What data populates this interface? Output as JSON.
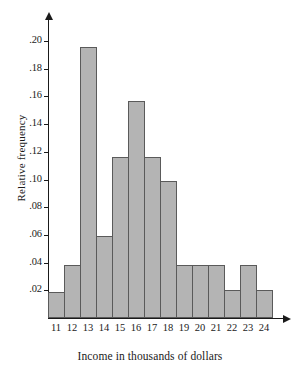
{
  "chart_data": {
    "type": "bar",
    "title": "",
    "subtitle": "",
    "xlabel": "Income in thousands of dollars",
    "ylabel": "Relative frequency",
    "categories": [
      "11",
      "12",
      "13",
      "14",
      "15",
      "16",
      "17",
      "18",
      "19",
      "20",
      "21",
      "22",
      "23",
      "24"
    ],
    "values": [
      0.019,
      0.038,
      0.196,
      0.059,
      0.116,
      0.157,
      0.116,
      0.099,
      0.038,
      0.038,
      0.038,
      0.02,
      0.038,
      0.02
    ],
    "xlim": [
      10.5,
      24.5
    ],
    "ylim": [
      0,
      0.205
    ],
    "ytick_labels": [
      ".20",
      ".18",
      ".16",
      ".14",
      ".12",
      ".10",
      ".08",
      ".06",
      ".04",
      ".02"
    ],
    "ytick_values": [
      0.2,
      0.18,
      0.16,
      0.14,
      0.12,
      0.1,
      0.08,
      0.06,
      0.04,
      0.02
    ],
    "xtick_labels": [
      "11",
      "12",
      "13",
      "14",
      "15",
      "16",
      "17",
      "18",
      "19",
      "20",
      "21",
      "22",
      "23",
      "24"
    ],
    "grid": false,
    "legend": null,
    "bar_fill_color": "#b4b4b4",
    "bar_edge_color": "#5a5a5a",
    "axis_color": "#1a1a1a"
  }
}
